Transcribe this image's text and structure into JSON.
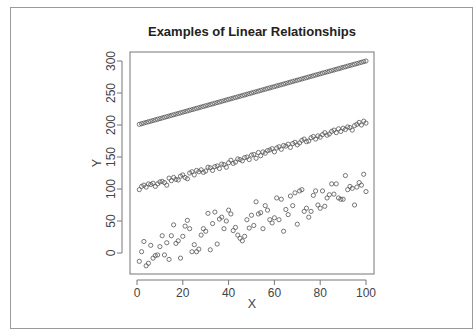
{
  "chart_data": {
    "type": "scatter",
    "title": "Examples of Linear Relationships",
    "xlabel": "X",
    "ylabel": "Y",
    "xlim": [
      -2,
      103
    ],
    "ylim": [
      -33,
      314
    ],
    "xticks": [
      0,
      20,
      40,
      60,
      80,
      100
    ],
    "yticks": [
      0,
      50,
      100,
      150,
      200,
      250,
      300
    ],
    "grid": false,
    "legend": null,
    "marker": "open-circle",
    "marker_color": "#555555",
    "series": [
      {
        "name": "perfect linear (y = 200 + x)",
        "x": "1..100",
        "formula": "y = 200 + x",
        "noise": 0
      },
      {
        "name": "linear with small noise (y ≈ 100 + x)",
        "x": "1..100",
        "formula": "y = 100 + x + e",
        "noise_sd": 4,
        "values": [
          99,
          104,
          106,
          103,
          108,
          107,
          109,
          104,
          108,
          111,
          112,
          110,
          106,
          117,
          113,
          118,
          115,
          114,
          120,
          122,
          118,
          116,
          125,
          127,
          122,
          129,
          127,
          130,
          126,
          128,
          134,
          133,
          129,
          135,
          136,
          132,
          139,
          138,
          134,
          141,
          145,
          140,
          142,
          147,
          146,
          144,
          149,
          150,
          146,
          153,
          154,
          148,
          157,
          152,
          158,
          156,
          160,
          161,
          163,
          158,
          164,
          166,
          162,
          168,
          167,
          170,
          165,
          171,
          173,
          169,
          172,
          176,
          178,
          174,
          175,
          180,
          182,
          178,
          183,
          181,
          185,
          188,
          184,
          186,
          190,
          192,
          188,
          194,
          190,
          195,
          193,
          197,
          196,
          192,
          199,
          201,
          204,
          200,
          206,
          203
        ]
      },
      {
        "name": "linear with large noise (y ≈ x)",
        "x": "1..100",
        "formula": "y = x + e",
        "noise_sd": 22,
        "values": [
          -13,
          2,
          18,
          -20,
          -16,
          12,
          -8,
          -4,
          -3,
          10,
          27,
          -3,
          16,
          -10,
          27,
          44,
          15,
          19,
          -8,
          26,
          42,
          51,
          38,
          2,
          13,
          2,
          6,
          28,
          38,
          34,
          62,
          5,
          46,
          64,
          14,
          53,
          56,
          38,
          50,
          67,
          61,
          35,
          40,
          28,
          23,
          19,
          26,
          52,
          39,
          59,
          43,
          80,
          61,
          63,
          38,
          74,
          67,
          52,
          47,
          55,
          86,
          52,
          84,
          34,
          68,
          60,
          89,
          74,
          94,
          45,
          97,
          99,
          65,
          70,
          56,
          65,
          90,
          97,
          75,
          70,
          97,
          73,
          86,
          91,
          108,
          92,
          108,
          86,
          84,
          84,
          121,
          99,
          104,
          101,
          75,
          103,
          110,
          106,
          123,
          96
        ]
      }
    ]
  }
}
